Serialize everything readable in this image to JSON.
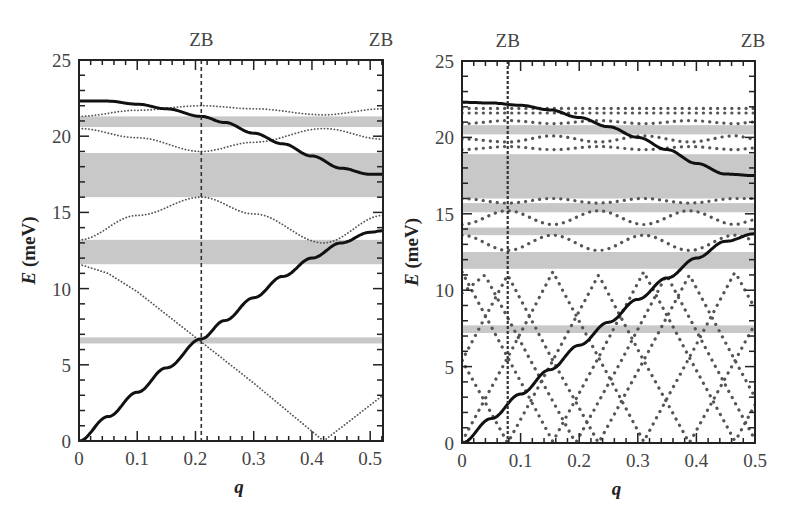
{
  "chart_data": [
    {
      "type": "line",
      "panel": "left",
      "title": "",
      "xlabel": "q",
      "ylabel": "E (meV)",
      "xlim": [
        0,
        0.522
      ],
      "ylim": [
        0,
        25
      ],
      "xticks": [
        "0",
        "0.1",
        "0.2",
        "0.3",
        "0.4",
        "0.5"
      ],
      "yticks": [
        "0",
        "5",
        "10",
        "15",
        "20",
        "25"
      ],
      "top_annotations": [
        {
          "label": "ZB",
          "q": 0.21
        },
        {
          "label": "ZB",
          "q": 0.522
        }
      ],
      "zb_line_q": 0.21,
      "gap_bands_meV": [
        [
          20.6,
          21.3
        ],
        [
          16.0,
          18.9
        ],
        [
          11.6,
          13.2
        ],
        [
          6.4,
          6.8
        ]
      ],
      "solid_series": [
        {
          "name": "upper solid branch",
          "x": [
            0,
            0.05,
            0.1,
            0.15,
            0.21,
            0.25,
            0.3,
            0.35,
            0.4,
            0.45,
            0.5,
            0.522
          ],
          "y": [
            22.3,
            22.3,
            22.1,
            21.8,
            21.3,
            20.9,
            20.2,
            19.5,
            18.7,
            17.9,
            17.5,
            17.5
          ]
        },
        {
          "name": "lower solid branch",
          "x": [
            0,
            0.05,
            0.1,
            0.15,
            0.21,
            0.25,
            0.3,
            0.35,
            0.4,
            0.45,
            0.5,
            0.522
          ],
          "y": [
            0,
            1.6,
            3.2,
            4.8,
            6.7,
            7.9,
            9.4,
            10.8,
            12.0,
            13.0,
            13.7,
            13.8
          ]
        }
      ],
      "dotted_series": [
        {
          "name": "folded 1",
          "x": [
            0,
            0.1,
            0.21,
            0.3,
            0.42,
            0.522
          ],
          "y": [
            21.3,
            21.7,
            22.0,
            21.8,
            21.4,
            21.8
          ]
        },
        {
          "name": "folded 2",
          "x": [
            0,
            0.1,
            0.21,
            0.3,
            0.42,
            0.522
          ],
          "y": [
            20.5,
            19.9,
            19.0,
            19.6,
            20.5,
            19.8
          ]
        },
        {
          "name": "folded 3",
          "x": [
            0,
            0.1,
            0.21,
            0.3,
            0.42,
            0.522
          ],
          "y": [
            13.2,
            14.8,
            16.0,
            14.9,
            13.0,
            14.8
          ]
        },
        {
          "name": "folded 4",
          "x": [
            0,
            0.05,
            0.1,
            0.21,
            0.3,
            0.42,
            0.522
          ],
          "y": [
            11.6,
            11.0,
            9.8,
            6.5,
            3.8,
            0.0,
            3.0
          ]
        }
      ]
    },
    {
      "type": "line",
      "panel": "right",
      "title": "",
      "xlabel": "q",
      "ylabel": "E (meV)",
      "xlim": [
        0,
        0.5
      ],
      "ylim": [
        0,
        25
      ],
      "xticks": [
        "0",
        "0.1",
        "0.2",
        "0.3",
        "0.4",
        "0.5"
      ],
      "yticks": [
        "0",
        "5",
        "10",
        "15",
        "20",
        "25"
      ],
      "top_annotations": [
        {
          "label": "ZB",
          "q": 0.078
        },
        {
          "label": "ZB",
          "q": 0.5
        }
      ],
      "zb_line_q": 0.078,
      "gap_bands_meV": [
        [
          20.2,
          20.8
        ],
        [
          16.0,
          18.9
        ],
        [
          15.1,
          15.7
        ],
        [
          13.6,
          14.1
        ],
        [
          11.4,
          12.5
        ],
        [
          7.2,
          7.7
        ]
      ],
      "solid_series": [
        {
          "name": "upper solid branch",
          "x": [
            0,
            0.05,
            0.1,
            0.15,
            0.2,
            0.25,
            0.3,
            0.35,
            0.4,
            0.45,
            0.5
          ],
          "y": [
            22.3,
            22.25,
            22.1,
            21.8,
            21.3,
            20.7,
            20.0,
            19.2,
            18.3,
            17.6,
            17.5
          ]
        },
        {
          "name": "lower solid branch",
          "x": [
            0,
            0.05,
            0.1,
            0.15,
            0.2,
            0.25,
            0.3,
            0.35,
            0.4,
            0.45,
            0.5
          ],
          "y": [
            0,
            1.6,
            3.2,
            4.8,
            6.4,
            7.9,
            9.4,
            10.8,
            12.1,
            13.2,
            13.7
          ]
        }
      ],
      "dotted_series": [
        {
          "name": "flat top 1",
          "x": [
            0,
            0.5
          ],
          "y": [
            21.9,
            21.9
          ]
        },
        {
          "name": "flat top 2",
          "x": [
            0,
            0.5
          ],
          "y": [
            21.6,
            21.6
          ]
        },
        {
          "name": "wavy 20.9",
          "x": [
            0,
            0.078,
            0.155,
            0.233,
            0.31,
            0.388,
            0.466,
            0.5
          ],
          "y": [
            20.9,
            21.1,
            20.9,
            21.1,
            20.9,
            21.1,
            20.9,
            21.0
          ]
        },
        {
          "name": "wavy 19.9",
          "x": [
            0,
            0.078,
            0.155,
            0.233,
            0.31,
            0.388,
            0.466,
            0.5
          ],
          "y": [
            19.9,
            19.7,
            20.1,
            19.7,
            20.1,
            19.7,
            20.1,
            19.9
          ]
        },
        {
          "name": "wavy 19.3",
          "x": [
            0,
            0.078,
            0.155,
            0.233,
            0.31,
            0.388,
            0.466,
            0.5
          ],
          "y": [
            19.2,
            19.4,
            19.2,
            19.4,
            19.2,
            19.4,
            19.2,
            19.3
          ]
        },
        {
          "name": "wavy 16",
          "x": [
            0,
            0.078,
            0.155,
            0.233,
            0.31,
            0.388,
            0.466,
            0.5
          ],
          "y": [
            16.0,
            15.7,
            16.0,
            15.7,
            16.0,
            15.7,
            16.0,
            16.0
          ]
        },
        {
          "name": "wavy 15",
          "x": [
            0,
            0.078,
            0.155,
            0.233,
            0.31,
            0.388,
            0.466,
            0.5
          ],
          "y": [
            14.3,
            15.2,
            14.3,
            15.2,
            14.3,
            15.2,
            14.3,
            14.6
          ]
        },
        {
          "name": "wavy 13.3",
          "x": [
            0,
            0.078,
            0.155,
            0.233,
            0.31,
            0.388,
            0.466,
            0.5
          ],
          "y": [
            13.6,
            12.6,
            13.6,
            12.6,
            13.6,
            12.6,
            13.6,
            13.3
          ]
        },
        {
          "name": "zigzag A",
          "x": [
            0,
            0.078,
            0.155,
            0.233,
            0.31,
            0.388,
            0.466,
            0.5
          ],
          "y": [
            11.2,
            5.6,
            0.1,
            5.6,
            11.2,
            5.6,
            0.1,
            2.5
          ]
        },
        {
          "name": "zigzag B",
          "x": [
            0,
            0.078,
            0.155,
            0.233,
            0.31,
            0.388,
            0.466,
            0.5
          ],
          "y": [
            0.1,
            5.6,
            11.2,
            5.6,
            0.1,
            5.6,
            11.2,
            8.8
          ]
        },
        {
          "name": "zigzag C",
          "x": [
            0,
            0.0,
            0.078,
            0.155,
            0.233,
            0.31,
            0.388,
            0.466,
            0.5
          ],
          "y": [
            5.4,
            5.4,
            11.0,
            5.4,
            0.0,
            5.4,
            11.0,
            5.4,
            3.0
          ]
        },
        {
          "name": "zigzag D",
          "x": [
            0,
            0.078,
            0.155,
            0.233,
            0.31,
            0.388,
            0.466,
            0.5
          ],
          "y": [
            5.4,
            0.0,
            5.4,
            11.0,
            5.4,
            0.0,
            5.4,
            7.8
          ]
        },
        {
          "name": "zigzag E",
          "x": [
            0,
            0.039,
            0.117,
            0.194,
            0.272,
            0.349,
            0.427,
            0.5
          ],
          "y": [
            9.8,
            11.0,
            5.4,
            0.0,
            5.4,
            11.0,
            5.4,
            0.2
          ]
        }
      ]
    }
  ],
  "panels": [
    {
      "id": "left",
      "zb_labels": [
        "ZB",
        "ZB"
      ],
      "ylabel_italic": "E",
      "ylabel_unit": " (meV)",
      "xlabel": "q",
      "xticks": [
        "0",
        "0.1",
        "0.2",
        "0.3",
        "0.4",
        "0.5"
      ],
      "yticks": [
        "0",
        "5",
        "10",
        "15",
        "20",
        "25"
      ]
    },
    {
      "id": "right",
      "zb_labels": [
        "ZB",
        "ZB"
      ],
      "ylabel_italic": "E",
      "ylabel_unit": " (meV)",
      "xlabel": "q",
      "xticks": [
        "0",
        "0.1",
        "0.2",
        "0.3",
        "0.4",
        "0.5"
      ],
      "yticks": [
        "0",
        "5",
        "10",
        "15",
        "20",
        "25"
      ]
    }
  ],
  "colors": {
    "band": "#c8c8c8",
    "solid": "#111111",
    "dotted": "#555555",
    "axis": "#222222",
    "zb_line": "#333333"
  }
}
